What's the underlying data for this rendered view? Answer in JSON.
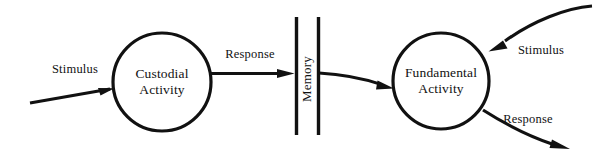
{
  "diagram": {
    "type": "data-flow-diagram",
    "background_color": "#ffffff",
    "ink_color": "#111111",
    "processes": [
      {
        "id": "custodial",
        "label_line1": "Custodial",
        "label_line2": "Activity",
        "shape": "circle",
        "cx": 162,
        "cy": 82,
        "r": 49
      },
      {
        "id": "fundamental",
        "label_line1": "Fundamental",
        "label_line2": "Activity",
        "shape": "circle",
        "cx": 441,
        "cy": 81,
        "r": 48
      }
    ],
    "stores": [
      {
        "id": "memory",
        "label": "Memory",
        "shape": "open-double-bar",
        "orientation": "vertical",
        "rotated_text": true,
        "bar_left_x": 296,
        "bar_right_x": 318,
        "bar_top_y": 17,
        "bar_bottom_y": 135
      }
    ],
    "flows": [
      {
        "id": "stimulus-in-left",
        "label": "Stimulus",
        "from": "external",
        "to": "custodial",
        "label_x": 75,
        "label_y": 73,
        "arrowhead": true
      },
      {
        "id": "response-to-memory",
        "label": "Response",
        "from": "custodial",
        "to": "memory",
        "label_x": 250,
        "label_y": 58,
        "arrowhead": true
      },
      {
        "id": "memory-to-fundamental",
        "label": "",
        "from": "memory",
        "to": "fundamental",
        "label_x": null,
        "label_y": null,
        "arrowhead": true
      },
      {
        "id": "stimulus-in-right",
        "label": "Stimulus",
        "from": "external",
        "to": "fundamental",
        "label_x": 541,
        "label_y": 54,
        "arrowhead": true
      },
      {
        "id": "response-out-right",
        "label": "Response",
        "from": "fundamental",
        "to": "external",
        "label_x": 528,
        "label_y": 123,
        "arrowhead": true
      }
    ]
  }
}
